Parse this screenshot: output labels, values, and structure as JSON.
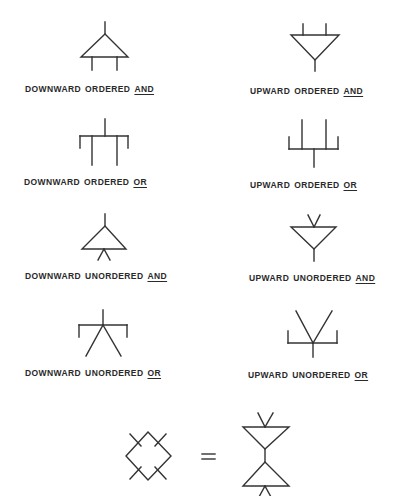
{
  "symbols": [
    {
      "id": "downward-ordered-and",
      "direction": "DOWNWARD",
      "ordering": "ORDERED",
      "gate": "AND"
    },
    {
      "id": "upward-ordered-and",
      "direction": "UPWARD",
      "ordering": "ORDERED",
      "gate": "AND"
    },
    {
      "id": "downward-ordered-or",
      "direction": "DOWNWARD",
      "ordering": "ORDERED",
      "gate": "OR"
    },
    {
      "id": "upward-ordered-or",
      "direction": "UPWARD",
      "ordering": "ORDERED",
      "gate": "OR"
    },
    {
      "id": "downward-unordered-and",
      "direction": "DOWNWARD",
      "ordering": "UNORDERED",
      "gate": "AND"
    },
    {
      "id": "upward-unordered-and",
      "direction": "UPWARD",
      "ordering": "UNORDERED",
      "gate": "AND"
    },
    {
      "id": "downward-unordered-or",
      "direction": "DOWNWARD",
      "ordering": "UNORDERED",
      "gate": "OR"
    },
    {
      "id": "upward-unordered-or",
      "direction": "UPWARD",
      "ordering": "UNORDERED",
      "gate": "OR"
    }
  ],
  "equivalence": {
    "left": "diamond-with-four-ticks",
    "operator": "=",
    "right": "upward-unordered-and-over-downward-unordered-and"
  },
  "colors": {
    "ink": "#333333",
    "background": "#ffffff"
  }
}
